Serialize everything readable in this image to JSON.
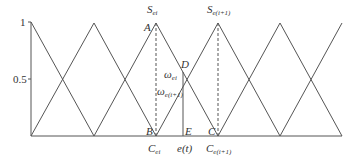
{
  "diagram": {
    "type": "triangular-membership-functions",
    "y_ticks": [
      {
        "label": "1",
        "value": 1
      },
      {
        "label": "0.5",
        "value": 0.5
      }
    ],
    "peaks_x": [
      31,
      94,
      156,
      218,
      280,
      342
    ],
    "points": {
      "A": "A",
      "B": "B",
      "C": "C",
      "D": "D",
      "E": "E"
    },
    "labels": {
      "s_ei_main": "S",
      "s_ei_sub": "ei",
      "s_ei1_main": "S",
      "s_ei1_sub": "e(i+1)",
      "omega_ei_main": "ω",
      "omega_ei_sub": "ei",
      "omega_ei1_main": "ω",
      "omega_ei1_sub": "e(i+1)",
      "c_ei_main": "C",
      "c_ei_sub": "ei",
      "c_ei1_main": "C",
      "c_ei1_sub": "e(i+1)",
      "et": "e(t)"
    },
    "colors": {
      "line": "#555555",
      "text": "#333333"
    }
  }
}
